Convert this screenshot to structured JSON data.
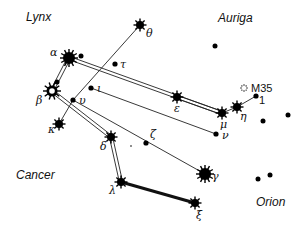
{
  "constellations": [
    {
      "name": "Lynx",
      "x": 26,
      "y": 21
    },
    {
      "name": "Auriga",
      "x": 218,
      "y": 22
    },
    {
      "name": "Cancer",
      "x": 16,
      "y": 179
    },
    {
      "name": "Orion",
      "x": 256,
      "y": 206
    }
  ],
  "stars": [
    {
      "id": "theta",
      "label": "θ",
      "x": 140,
      "y": 25,
      "size": "medium",
      "lx": 146,
      "ly": 37
    },
    {
      "id": "alpha",
      "label": "α",
      "x": 69,
      "y": 58,
      "size": "large",
      "lx": 50,
      "ly": 56
    },
    {
      "id": "tau",
      "label": "τ",
      "x": 115,
      "y": 64,
      "size": "small",
      "lx": 120,
      "ly": 68
    },
    {
      "id": "iota",
      "label": "ι",
      "x": 91,
      "y": 88,
      "size": "small",
      "lx": 97,
      "ly": 92
    },
    {
      "id": "beta",
      "label": "β",
      "x": 52,
      "y": 91,
      "size": "ring",
      "lx": 36,
      "ly": 104
    },
    {
      "id": "upsilon",
      "label": "υ",
      "x": 73,
      "y": 100,
      "size": "small",
      "lx": 79,
      "ly": 104
    },
    {
      "id": "kappa",
      "label": "κ",
      "x": 59,
      "y": 124,
      "size": "medium",
      "lx": 48,
      "ly": 133
    },
    {
      "id": "delta",
      "label": "δ",
      "x": 111,
      "y": 137,
      "size": "medium",
      "lx": 100,
      "ly": 150
    },
    {
      "id": "zeta",
      "label": "ζ",
      "x": 146,
      "y": 143,
      "size": "small",
      "lx": 150,
      "ly": 138
    },
    {
      "id": "epsilon",
      "label": "ε",
      "x": 177,
      "y": 97,
      "size": "medium",
      "lx": 174,
      "ly": 112
    },
    {
      "id": "mu",
      "label": "μ",
      "x": 222,
      "y": 113,
      "size": "medium",
      "lx": 220,
      "ly": 128
    },
    {
      "id": "eta",
      "label": "η",
      "x": 237,
      "y": 107,
      "size": "medium",
      "lx": 240,
      "ly": 120
    },
    {
      "id": "one",
      "label": "1",
      "x": 256,
      "y": 96,
      "size": "small",
      "lx": 259,
      "ly": 104
    },
    {
      "id": "nu",
      "label": "ν",
      "x": 216,
      "y": 134,
      "size": "small",
      "lx": 222,
      "ly": 139
    },
    {
      "id": "gamma",
      "label": "γ",
      "x": 205,
      "y": 174,
      "size": "large",
      "lx": 212,
      "ly": 180
    },
    {
      "id": "lambda",
      "label": "λ",
      "x": 121,
      "y": 182,
      "size": "medium",
      "lx": 109,
      "ly": 194
    },
    {
      "id": "xi",
      "label": "ξ",
      "x": 195,
      "y": 203,
      "size": "medium",
      "lx": 196,
      "ly": 219
    }
  ],
  "cluster": {
    "label": "M35",
    "x": 244,
    "y": 88,
    "lx": 251,
    "ly": 92
  },
  "extra_dots": [
    {
      "x": 81,
      "y": 56
    },
    {
      "x": 57,
      "y": 82
    },
    {
      "x": 215,
      "y": 46
    },
    {
      "x": 263,
      "y": 121
    },
    {
      "x": 288,
      "y": 115
    },
    {
      "x": 258,
      "y": 179
    },
    {
      "x": 270,
      "y": 175
    },
    {
      "x": 131,
      "y": 146
    }
  ],
  "double_lines": [
    [
      "alpha",
      "mu"
    ],
    [
      "alpha",
      "beta"
    ],
    [
      "beta",
      "delta"
    ],
    [
      "delta",
      "lambda"
    ],
    [
      "epsilon",
      "mu"
    ]
  ],
  "thick_lines": [
    [
      "lambda",
      "xi"
    ]
  ],
  "single_lines": [
    [
      "theta",
      "upsilon"
    ],
    [
      "iota",
      "nu"
    ],
    [
      "upsilon",
      "gamma"
    ],
    [
      "upsilon",
      "kappa"
    ],
    [
      "mu",
      "eta"
    ],
    [
      "eta",
      "one"
    ]
  ]
}
